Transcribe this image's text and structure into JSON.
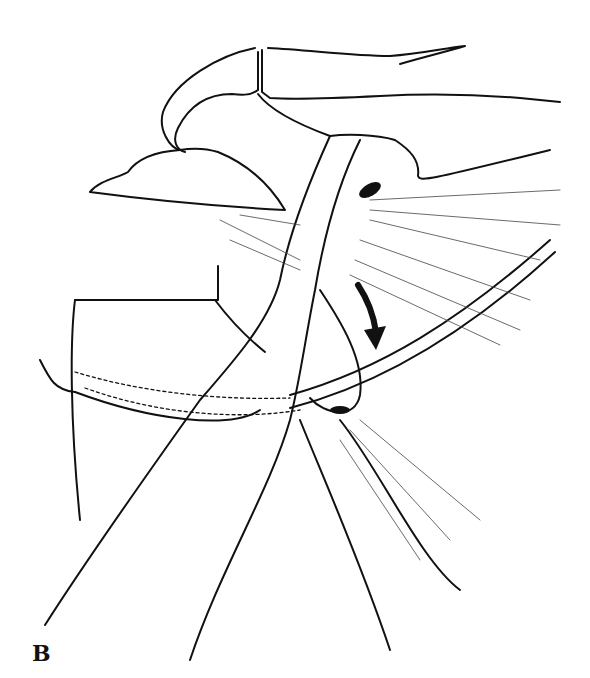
{
  "figure": {
    "panel_label": "B",
    "colors": {
      "ink": "#111111",
      "background": "#ffffff"
    }
  }
}
